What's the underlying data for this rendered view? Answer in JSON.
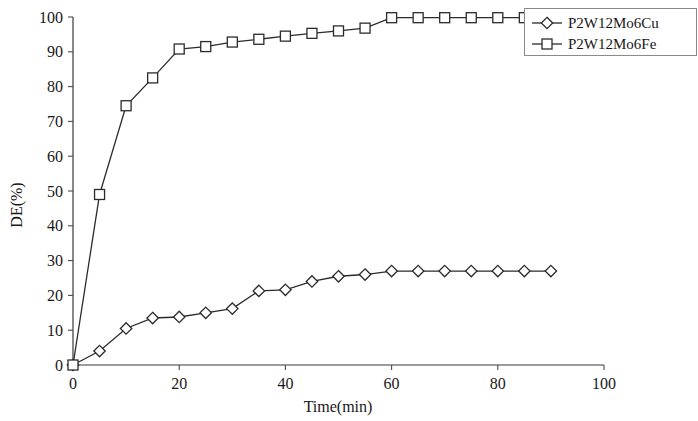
{
  "chart_data": {
    "type": "line",
    "title": "",
    "xlabel": "Time(min)",
    "ylabel": "DE(%)",
    "xlim": [
      0,
      100
    ],
    "ylim": [
      0,
      100
    ],
    "xticks": [
      0,
      20,
      40,
      60,
      80,
      100
    ],
    "xtick_labels": [
      "0",
      "20",
      "40",
      "60",
      "80",
      "100"
    ],
    "yticks": [
      0,
      10,
      20,
      30,
      40,
      50,
      60,
      70,
      80,
      90,
      100
    ],
    "ytick_labels": [
      "0",
      "10",
      "20",
      "30",
      "40",
      "50",
      "60",
      "70",
      "80",
      "90",
      "100"
    ],
    "grid": false,
    "legend_position": "top-right",
    "series": [
      {
        "name": "P2W12Mo6Cu",
        "marker": "diamond",
        "color": "#2b2b2b",
        "x": [
          0,
          5,
          10,
          15,
          20,
          25,
          30,
          35,
          40,
          45,
          50,
          55,
          60,
          65,
          70,
          75,
          80,
          85,
          90
        ],
        "values": [
          0,
          4,
          10.5,
          13.5,
          13.8,
          15,
          16.2,
          21.3,
          21.6,
          24,
          25.5,
          26,
          27,
          27,
          27,
          27,
          27,
          27,
          27
        ]
      },
      {
        "name": "P2W12Mo6Fe",
        "marker": "square",
        "color": "#2b2b2b",
        "x": [
          0,
          5,
          10,
          15,
          20,
          25,
          30,
          35,
          40,
          45,
          50,
          55,
          60,
          65,
          70,
          75,
          80,
          85
        ],
        "values": [
          0,
          49,
          74.5,
          82.5,
          90.8,
          91.5,
          92.8,
          93.6,
          94.5,
          95.3,
          96,
          96.8,
          99.8,
          99.8,
          99.8,
          99.8,
          99.8,
          99.8
        ]
      }
    ]
  },
  "legend": {
    "entries": [
      {
        "label": "P2W12Mo6Cu",
        "marker": "diamond"
      },
      {
        "label": "P2W12Mo6Fe",
        "marker": "square"
      }
    ]
  },
  "axes": {
    "x_title": "Time(min)",
    "y_title": "DE(%)"
  }
}
